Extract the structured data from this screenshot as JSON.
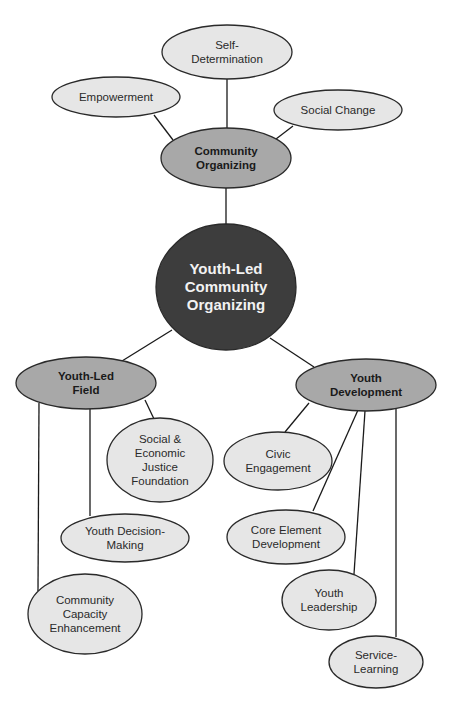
{
  "diagram": {
    "type": "concept-map",
    "colors": {
      "center_fill": "#3d3d3d",
      "branch_fill": "#a8a8a8",
      "leaf_fill": "#e6e6e6",
      "stroke": "#2a2a2a"
    },
    "nodes": {
      "center": {
        "lines": [
          "Youth-Led",
          "Community",
          "Organizing"
        ],
        "cx": 226,
        "cy": 287,
        "rx": 70,
        "ry": 63,
        "level": 0
      },
      "community_organizing": {
        "lines": [
          "Community",
          "Organizing"
        ],
        "cx": 226,
        "cy": 158,
        "rx": 65,
        "ry": 30,
        "level": 1
      },
      "youth_led_field": {
        "lines": [
          "Youth-Led",
          "Field"
        ],
        "cx": 86,
        "cy": 383,
        "rx": 70,
        "ry": 26,
        "level": 1
      },
      "youth_development": {
        "lines": [
          "Youth",
          "Development"
        ],
        "cx": 366,
        "cy": 385,
        "rx": 70,
        "ry": 26,
        "level": 1
      },
      "self_determination": {
        "lines": [
          "Self-",
          "Determination"
        ],
        "cx": 227,
        "cy": 52,
        "rx": 65,
        "ry": 27,
        "level": 2
      },
      "empowerment": {
        "lines": [
          "Empowerment"
        ],
        "cx": 116,
        "cy": 97,
        "rx": 64,
        "ry": 20,
        "level": 2
      },
      "social_change": {
        "lines": [
          "Social Change"
        ],
        "cx": 338,
        "cy": 110,
        "rx": 64,
        "ry": 20,
        "level": 2
      },
      "social_economic_justice": {
        "lines": [
          "Social &",
          "Economic",
          "Justice",
          "Foundation"
        ],
        "cx": 160,
        "cy": 460,
        "rx": 53,
        "ry": 42,
        "level": 2
      },
      "youth_decision_making": {
        "lines": [
          "Youth Decision-",
          "Making"
        ],
        "cx": 125,
        "cy": 538,
        "rx": 64,
        "ry": 24,
        "level": 2
      },
      "community_capacity": {
        "lines": [
          "Community",
          "Capacity",
          "Enhancement"
        ],
        "cx": 85,
        "cy": 614,
        "rx": 57,
        "ry": 40,
        "level": 2
      },
      "civic_engagement": {
        "lines": [
          "Civic",
          "Engagement"
        ],
        "cx": 278,
        "cy": 461,
        "rx": 54,
        "ry": 29,
        "level": 2
      },
      "core_element": {
        "lines": [
          "Core Element",
          "Development"
        ],
        "cx": 286,
        "cy": 537,
        "rx": 59,
        "ry": 27,
        "level": 2
      },
      "youth_leadership": {
        "lines": [
          "Youth",
          "Leadership"
        ],
        "cx": 329,
        "cy": 600,
        "rx": 47,
        "ry": 30,
        "level": 2
      },
      "service_learning": {
        "lines": [
          "Service-",
          "Learning"
        ],
        "cx": 376,
        "cy": 662,
        "rx": 47,
        "ry": 26,
        "level": 2
      }
    },
    "edges": [
      {
        "from": "community_organizing",
        "to": "self_determination",
        "x1": 227,
        "y1": 128,
        "x2": 227,
        "y2": 79
      },
      {
        "from": "community_organizing",
        "to": "empowerment",
        "x1": 173,
        "y1": 140,
        "x2": 154,
        "y2": 115
      },
      {
        "from": "community_organizing",
        "to": "social_change",
        "x1": 276,
        "y1": 139,
        "x2": 293,
        "y2": 126
      },
      {
        "from": "community_organizing",
        "to": "center",
        "x1": 226,
        "y1": 188,
        "x2": 226,
        "y2": 224
      },
      {
        "from": "center",
        "to": "youth_led_field",
        "x1": 172,
        "y1": 330,
        "x2": 122,
        "y2": 361
      },
      {
        "from": "center",
        "to": "youth_development",
        "x1": 270,
        "y1": 338,
        "x2": 314,
        "y2": 367
      },
      {
        "from": "youth_led_field",
        "to": "social_economic_justice",
        "x1": 145,
        "y1": 400,
        "x2": 154,
        "y2": 419
      },
      {
        "from": "youth_led_field",
        "to": "youth_decision_making",
        "x1": 90,
        "y1": 409,
        "x2": 90,
        "y2": 516
      },
      {
        "from": "youth_led_field",
        "to": "community_capacity",
        "x1": 39,
        "y1": 403,
        "x2": 38,
        "y2": 591
      },
      {
        "from": "youth_development",
        "to": "civic_engagement",
        "x1": 309,
        "y1": 403,
        "x2": 285,
        "y2": 432
      },
      {
        "from": "youth_development",
        "to": "core_element",
        "x1": 358,
        "y1": 410,
        "x2": 313,
        "y2": 511
      },
      {
        "from": "youth_development",
        "to": "youth_leadership",
        "x1": 365,
        "y1": 411,
        "x2": 354,
        "y2": 574
      },
      {
        "from": "youth_development",
        "to": "service_learning",
        "x1": 396,
        "y1": 409,
        "x2": 396,
        "y2": 637
      }
    ]
  }
}
